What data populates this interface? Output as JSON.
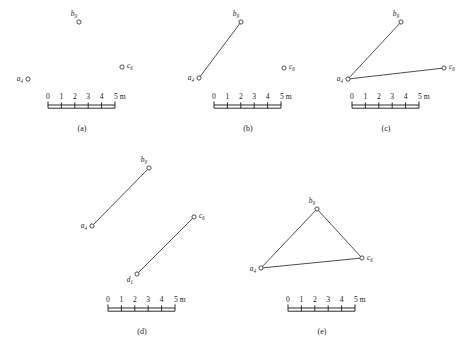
{
  "figure": {
    "kind": "survey-triangulation-construction-sequence",
    "point_labels": {
      "a": {
        "base": "a",
        "sub": "4"
      },
      "b": {
        "base": "b",
        "sub": "9"
      },
      "c": {
        "base": "c",
        "sub": "6"
      },
      "d": {
        "base": "d",
        "sub": "1"
      }
    },
    "scale_bar": {
      "ticks": [
        "0",
        "1",
        "2",
        "3",
        "4",
        "5"
      ],
      "unit": "m",
      "last_with_unit": "5 m"
    },
    "colors": {
      "ink": "#1a1a1a",
      "line": "#3a3a3a",
      "rule": "#2a2a2a",
      "background": "#ffffff"
    },
    "panels": [
      {
        "caption": "(a)",
        "nodes": [
          {
            "id": "b",
            "x": 79,
            "y": 22,
            "label_dx": -2,
            "label_dy": -6,
            "anchor": "end"
          },
          {
            "id": "c",
            "x": 122,
            "y": 67,
            "label_dx": 5,
            "label_dy": 1,
            "anchor": "start"
          },
          {
            "id": "a",
            "x": 28,
            "y": 79,
            "label_dx": -5,
            "label_dy": 2,
            "anchor": "end"
          }
        ],
        "edges": [],
        "bar": {
          "x0": 48,
          "x1": 115,
          "y": 105
        },
        "caption_x": 82,
        "caption_y": 131
      },
      {
        "caption": "(b)",
        "nodes": [
          {
            "id": "b",
            "x": 241,
            "y": 22,
            "label_dx": -2,
            "label_dy": -6,
            "anchor": "end"
          },
          {
            "id": "c",
            "x": 284,
            "y": 68,
            "label_dx": 5,
            "label_dy": 1,
            "anchor": "start"
          },
          {
            "id": "a",
            "x": 199,
            "y": 78,
            "label_dx": -5,
            "label_dy": 2,
            "anchor": "end"
          }
        ],
        "edges": [
          [
            "a",
            "b"
          ]
        ],
        "bar": {
          "x0": 214,
          "x1": 281,
          "y": 105
        },
        "caption_x": 248,
        "caption_y": 131
      },
      {
        "caption": "(c)",
        "nodes": [
          {
            "id": "b",
            "x": 401,
            "y": 22,
            "label_dx": -2,
            "label_dy": -6,
            "anchor": "end"
          },
          {
            "id": "c",
            "x": 444,
            "y": 68,
            "label_dx": 5,
            "label_dy": 1,
            "anchor": "start"
          },
          {
            "id": "a",
            "x": 348,
            "y": 79,
            "label_dx": -5,
            "label_dy": 2,
            "anchor": "end"
          }
        ],
        "edges": [
          [
            "a",
            "b"
          ],
          [
            "a",
            "c"
          ]
        ],
        "bar": {
          "x0": 352,
          "x1": 419,
          "y": 105
        },
        "caption_x": 386,
        "caption_y": 131
      },
      {
        "caption": "(d)",
        "nodes": [
          {
            "id": "b",
            "x": 149,
            "y": 168,
            "label_dx": -2,
            "label_dy": -6,
            "anchor": "end"
          },
          {
            "id": "c",
            "x": 194,
            "y": 217,
            "label_dx": 5,
            "label_dy": 1,
            "anchor": "start"
          },
          {
            "id": "a",
            "x": 92,
            "y": 226,
            "label_dx": -5,
            "label_dy": 2,
            "anchor": "end"
          },
          {
            "id": "d",
            "x": 137,
            "y": 274,
            "label_dx": -4,
            "label_dy": 8,
            "anchor": "end"
          }
        ],
        "edges": [
          [
            "a",
            "b"
          ],
          [
            "d",
            "c"
          ]
        ],
        "bar": {
          "x0": 108,
          "x1": 175,
          "y": 308
        },
        "caption_x": 142,
        "caption_y": 334
      },
      {
        "caption": "(e)",
        "nodes": [
          {
            "id": "b",
            "x": 317,
            "y": 209,
            "label_dx": -2,
            "label_dy": -6,
            "anchor": "end"
          },
          {
            "id": "c",
            "x": 362,
            "y": 258,
            "label_dx": 5,
            "label_dy": 2,
            "anchor": "start"
          },
          {
            "id": "a",
            "x": 261,
            "y": 268,
            "label_dx": -5,
            "label_dy": 3,
            "anchor": "end"
          }
        ],
        "edges": [
          [
            "a",
            "b"
          ],
          [
            "b",
            "c"
          ],
          [
            "a",
            "c"
          ]
        ],
        "bar": {
          "x0": 288,
          "x1": 355,
          "y": 308
        },
        "caption_x": 322,
        "caption_y": 334
      }
    ]
  }
}
